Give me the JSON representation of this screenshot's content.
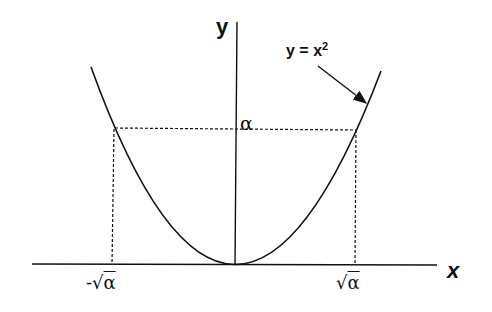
{
  "diagram": {
    "axis_labels": {
      "x": "x",
      "y": "y"
    },
    "curve_label": {
      "base": "y = x",
      "exponent": "2"
    },
    "level_label": "α",
    "tick_labels": {
      "negative_root": {
        "prefix": "-√",
        "radicand": "α"
      },
      "positive_root": {
        "prefix": "√",
        "radicand": "α"
      }
    },
    "colors": {
      "ink": "#111111",
      "background": "#ffffff"
    }
  }
}
